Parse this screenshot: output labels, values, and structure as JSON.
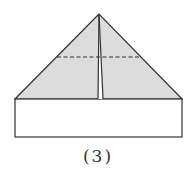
{
  "figure": {
    "caption": "(3)",
    "colors": {
      "fill": "#dcdcdc",
      "stroke": "#333333",
      "background": "#ffffff"
    },
    "shapes": {
      "triangle": {
        "apex": [
          99,
          14
        ],
        "base_left": [
          15,
          99
        ],
        "base_right": [
          182,
          99
        ]
      },
      "rectangle": {
        "x": 15,
        "y": 99,
        "width": 167,
        "height": 38
      },
      "center_fold_left": {
        "from": [
          99,
          14
        ],
        "to": [
          98,
          99
        ]
      },
      "center_fold_right": {
        "from": [
          99,
          14
        ],
        "to": [
          103,
          99
        ]
      },
      "dashed_fold": {
        "from": [
          57,
          57
        ],
        "to": [
          140,
          57
        ]
      }
    }
  }
}
